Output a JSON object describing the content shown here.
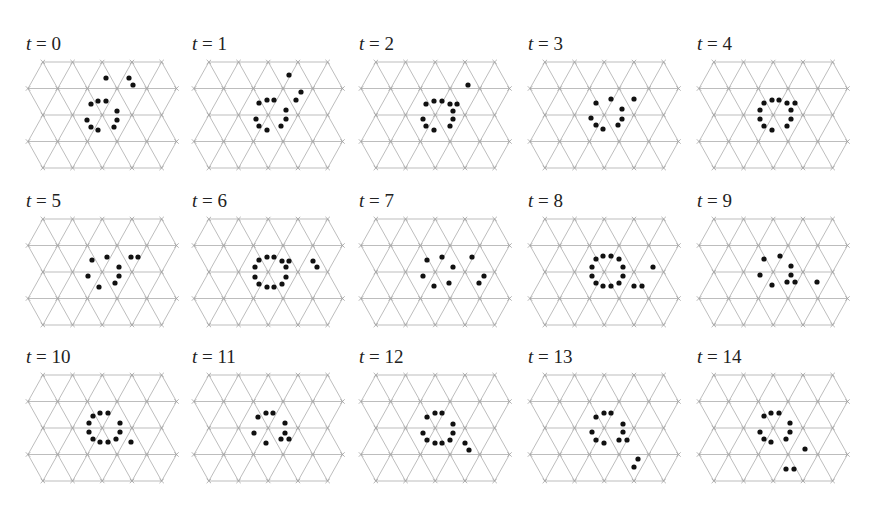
{
  "figure": {
    "lattice": {
      "rows": 5,
      "dx": 29.7,
      "dy": 26.5,
      "line_color": "#b5b5b5",
      "dot_color": "#111111"
    },
    "layout": {
      "col_origins_x": [
        28,
        194,
        361,
        530,
        699
      ],
      "row_origins_y": [
        62,
        219,
        375
      ],
      "label_offset_y": -27
    },
    "panels": [
      {
        "label_var": "t",
        "label_eq": " = ",
        "label_val": "0",
        "row": 0,
        "col": 0,
        "dots": [
          [
            78,
            16
          ],
          [
            101,
            16
          ],
          [
            105,
            23
          ],
          [
            63,
            42
          ],
          [
            70,
            39
          ],
          [
            78,
            39
          ],
          [
            89,
            49
          ],
          [
            89,
            58
          ],
          [
            59,
            58
          ],
          [
            63,
            65
          ],
          [
            70,
            68
          ],
          [
            86,
            65
          ]
        ]
      },
      {
        "label_var": "t",
        "label_eq": " = ",
        "label_val": "1",
        "row": 0,
        "col": 1,
        "dots": [
          [
            95,
            13
          ],
          [
            107,
            30
          ],
          [
            102,
            38
          ],
          [
            65,
            41
          ],
          [
            73,
            38
          ],
          [
            80,
            38
          ],
          [
            92,
            48
          ],
          [
            92,
            57
          ],
          [
            62,
            57
          ],
          [
            65,
            64
          ],
          [
            73,
            68
          ],
          [
            87,
            64
          ]
        ]
      },
      {
        "label_var": "t",
        "label_eq": " = ",
        "label_val": "2",
        "row": 0,
        "col": 2,
        "dots": [
          [
            107,
            23
          ],
          [
            65,
            42
          ],
          [
            73,
            39
          ],
          [
            81,
            39
          ],
          [
            89,
            42
          ],
          [
            96,
            42
          ],
          [
            92,
            49
          ],
          [
            92,
            57
          ],
          [
            62,
            57
          ],
          [
            65,
            64
          ],
          [
            73,
            68
          ],
          [
            89,
            64
          ]
        ]
      },
      {
        "label_var": "t",
        "label_eq": " = ",
        "label_val": "3",
        "row": 0,
        "col": 3,
        "dots": [
          [
            66,
            41
          ],
          [
            81,
            37
          ],
          [
            104,
            37
          ],
          [
            92,
            47
          ],
          [
            92,
            57
          ],
          [
            61,
            56
          ],
          [
            66,
            63
          ],
          [
            73,
            67
          ],
          [
            88,
            63
          ]
        ]
      },
      {
        "label_var": "t",
        "label_eq": " = ",
        "label_val": "4",
        "row": 0,
        "col": 4,
        "dots": [
          [
            65,
            41
          ],
          [
            73,
            38
          ],
          [
            80,
            38
          ],
          [
            88,
            41
          ],
          [
            96,
            41
          ],
          [
            92,
            48
          ],
          [
            92,
            57
          ],
          [
            88,
            64
          ],
          [
            61,
            48
          ],
          [
            61,
            57
          ],
          [
            65,
            64
          ],
          [
            73,
            68
          ]
        ]
      },
      {
        "label_var": "t",
        "label_eq": " = ",
        "label_val": "5",
        "row": 1,
        "col": 0,
        "dots": [
          [
            64,
            41
          ],
          [
            79,
            38
          ],
          [
            103,
            38
          ],
          [
            110,
            38
          ],
          [
            91,
            48
          ],
          [
            91,
            57
          ],
          [
            60,
            57
          ],
          [
            87,
            64
          ],
          [
            71,
            68
          ]
        ]
      },
      {
        "label_var": "t",
        "label_eq": " = ",
        "label_val": "6",
        "row": 1,
        "col": 1,
        "dots": [
          [
            65,
            41
          ],
          [
            73,
            38
          ],
          [
            80,
            38
          ],
          [
            88,
            42
          ],
          [
            95,
            42
          ],
          [
            92,
            48
          ],
          [
            92,
            58
          ],
          [
            88,
            65
          ],
          [
            80,
            68
          ],
          [
            73,
            68
          ],
          [
            65,
            65
          ],
          [
            61,
            58
          ],
          [
            61,
            48
          ],
          [
            119,
            42
          ],
          [
            123,
            48
          ]
        ]
      },
      {
        "label_var": "t",
        "label_eq": " = ",
        "label_val": "7",
        "row": 1,
        "col": 2,
        "dots": [
          [
            66,
            41
          ],
          [
            81,
            38
          ],
          [
            111,
            38
          ],
          [
            92,
            48
          ],
          [
            62,
            57
          ],
          [
            123,
            57
          ],
          [
            73,
            67
          ],
          [
            88,
            64
          ],
          [
            118,
            64
          ]
        ]
      },
      {
        "label_var": "t",
        "label_eq": " = ",
        "label_val": "8",
        "row": 1,
        "col": 3,
        "dots": [
          [
            66,
            40
          ],
          [
            73,
            37
          ],
          [
            81,
            37
          ],
          [
            89,
            40
          ],
          [
            93,
            48
          ],
          [
            93,
            57
          ],
          [
            89,
            64
          ],
          [
            81,
            67
          ],
          [
            73,
            67
          ],
          [
            66,
            64
          ],
          [
            62,
            57
          ],
          [
            62,
            48
          ],
          [
            123,
            48
          ],
          [
            104,
            67
          ],
          [
            112,
            67
          ]
        ]
      },
      {
        "label_var": "t",
        "label_eq": " = ",
        "label_val": "9",
        "row": 1,
        "col": 4,
        "dots": [
          [
            65,
            40
          ],
          [
            81,
            37
          ],
          [
            92,
            47
          ],
          [
            92,
            56
          ],
          [
            61,
            56
          ],
          [
            88,
            63
          ],
          [
            96,
            63
          ],
          [
            73,
            66
          ],
          [
            118,
            63
          ]
        ]
      },
      {
        "label_var": "t",
        "label_eq": " = ",
        "label_val": "10",
        "row": 2,
        "col": 0,
        "dots": [
          [
            65,
            41
          ],
          [
            72,
            38
          ],
          [
            80,
            38
          ],
          [
            92,
            48
          ],
          [
            92,
            57
          ],
          [
            61,
            48
          ],
          [
            61,
            57
          ],
          [
            65,
            64
          ],
          [
            72,
            67
          ],
          [
            80,
            67
          ],
          [
            88,
            64
          ],
          [
            103,
            67
          ]
        ]
      },
      {
        "label_var": "t",
        "label_eq": " = ",
        "label_val": "11",
        "row": 2,
        "col": 1,
        "dots": [
          [
            64,
            42
          ],
          [
            72,
            38
          ],
          [
            79,
            38
          ],
          [
            91,
            48
          ],
          [
            91,
            58
          ],
          [
            60,
            58
          ],
          [
            87,
            64
          ],
          [
            95,
            64
          ],
          [
            72,
            68
          ]
        ]
      },
      {
        "label_var": "t",
        "label_eq": " = ",
        "label_val": "12",
        "row": 2,
        "col": 2,
        "dots": [
          [
            66,
            42
          ],
          [
            74,
            38
          ],
          [
            81,
            38
          ],
          [
            92,
            49
          ],
          [
            92,
            58
          ],
          [
            62,
            58
          ],
          [
            66,
            65
          ],
          [
            74,
            68
          ],
          [
            81,
            68
          ],
          [
            89,
            65
          ],
          [
            104,
            68
          ],
          [
            108,
            75
          ]
        ]
      },
      {
        "label_var": "t",
        "label_eq": " = ",
        "label_val": "13",
        "row": 2,
        "col": 3,
        "dots": [
          [
            66,
            42
          ],
          [
            74,
            38
          ],
          [
            81,
            38
          ],
          [
            93,
            49
          ],
          [
            93,
            57
          ],
          [
            62,
            57
          ],
          [
            66,
            65
          ],
          [
            74,
            68
          ],
          [
            89,
            65
          ],
          [
            97,
            65
          ],
          [
            108,
            84
          ],
          [
            104,
            92
          ]
        ]
      },
      {
        "label_var": "t",
        "label_eq": " = ",
        "label_val": "14",
        "row": 2,
        "col": 4,
        "dots": [
          [
            65,
            41
          ],
          [
            72,
            38
          ],
          [
            80,
            38
          ],
          [
            91,
            48
          ],
          [
            91,
            57
          ],
          [
            61,
            57
          ],
          [
            65,
            64
          ],
          [
            72,
            67
          ],
          [
            87,
            64
          ],
          [
            106,
            74
          ],
          [
            87,
            94
          ],
          [
            95,
            94
          ]
        ]
      }
    ]
  }
}
